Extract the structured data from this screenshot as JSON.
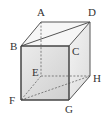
{
  "diagram": {
    "vertices": {
      "A": {
        "label": "A",
        "x": 41,
        "y": 22
      },
      "B": {
        "label": "B",
        "x": 21,
        "y": 46
      },
      "C": {
        "label": "C",
        "x": 69,
        "y": 46
      },
      "D": {
        "label": "D",
        "x": 90,
        "y": 22
      },
      "E": {
        "label": "E",
        "x": 41,
        "y": 76
      },
      "F": {
        "label": "F",
        "x": 21,
        "y": 100
      },
      "G": {
        "label": "G",
        "x": 69,
        "y": 100
      },
      "H": {
        "label": "H",
        "x": 90,
        "y": 76
      }
    },
    "solid_edges": [
      "AB",
      "AD",
      "BC",
      "CD",
      "BD",
      "BF",
      "CG",
      "DH",
      "FG",
      "GH"
    ],
    "dashed_edges": [
      "AE",
      "EF",
      "EH",
      "FH"
    ],
    "colors": {
      "edge": "#555555",
      "front_face_top": "#e6e6e6",
      "front_face_bottom": "#c8c8c8",
      "side_face": "#f0f0f0",
      "top_face": "#f7f7f7"
    }
  }
}
